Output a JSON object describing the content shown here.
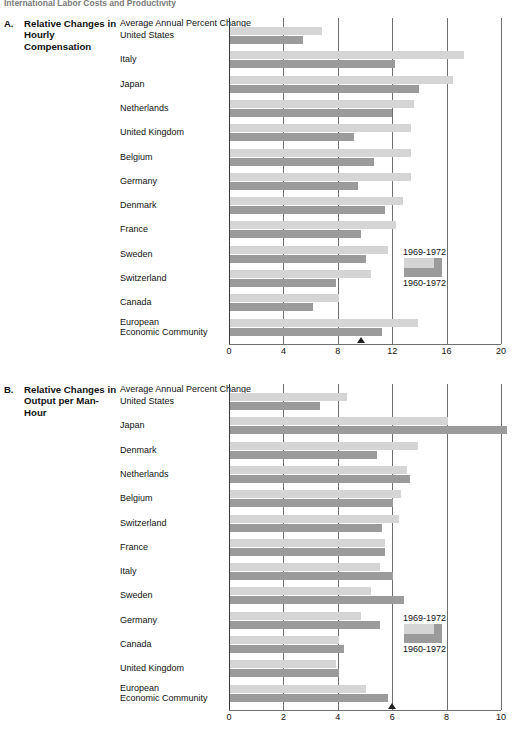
{
  "page_header": "International Labor Costs and Productivity",
  "legend": {
    "top_label": "1969-1972",
    "bottom_label": "1960-1972",
    "light_color": "#d5d5d5",
    "dark_color": "#9b9b9b"
  },
  "panels": [
    {
      "letter": "A.",
      "title": "Relative Changes in Hourly Compensation",
      "axis_caption": "Average Annual Percent Change"
    },
    {
      "letter": "B.",
      "title": "Relative Changes in Output per Man-Hour",
      "axis_caption": "Average Annual Percent Change"
    }
  ],
  "chart_data": [
    {
      "type": "bar",
      "title": "Relative Changes in Hourly Compensation",
      "subtitle": "Average Annual Percent Change",
      "orientation": "horizontal",
      "xlabel": "Average Annual Percent Change",
      "ylabel": "",
      "xlim": [
        0,
        20
      ],
      "xticks": [
        0,
        4,
        8,
        12,
        16,
        20
      ],
      "grid": true,
      "legend": [
        "1969-1972",
        "1960-1972"
      ],
      "legend_position": "inside-right",
      "annotation_marker": {
        "value": 9.7,
        "symbol": "triangle-up"
      },
      "categories": [
        "United States",
        "Italy",
        "Japan",
        "Netherlands",
        "United Kingdom",
        "Belgium",
        "Germany",
        "Denmark",
        "France",
        "Sweden",
        "Switzerland",
        "Canada",
        "European Economic Community"
      ],
      "series": [
        {
          "name": "1969-1972",
          "values": [
            6.8,
            17.2,
            16.4,
            13.5,
            13.3,
            13.3,
            13.3,
            12.7,
            12.2,
            11.6,
            10.4,
            8.0,
            13.8
          ]
        },
        {
          "name": "1960-1972",
          "values": [
            5.4,
            12.1,
            13.9,
            11.9,
            9.1,
            10.6,
            9.4,
            11.4,
            9.6,
            10.0,
            7.8,
            6.1,
            11.2
          ]
        }
      ]
    },
    {
      "type": "bar",
      "title": "Relative Changes in Output per Man-Hour",
      "subtitle": "Average Annual Percent Change",
      "orientation": "horizontal",
      "xlabel": "Average Annual Percent Change",
      "ylabel": "",
      "xlim": [
        0,
        10
      ],
      "xticks": [
        0,
        2,
        4,
        6,
        8,
        10
      ],
      "grid": true,
      "legend": [
        "1969-1972",
        "1960-1972"
      ],
      "legend_position": "inside-right",
      "annotation_marker": {
        "value": 6.0,
        "symbol": "triangle-up"
      },
      "categories": [
        "United States",
        "Japan",
        "Denmark",
        "Netherlands",
        "Belgium",
        "Switzerland",
        "France",
        "Italy",
        "Sweden",
        "Germany",
        "Canada",
        "United Kingdom",
        "European Economic Community"
      ],
      "series": [
        {
          "name": "1969-1972",
          "values": [
            4.3,
            8.0,
            6.9,
            6.5,
            6.3,
            6.2,
            5.7,
            5.5,
            5.2,
            4.8,
            4.0,
            3.9,
            5.0
          ]
        },
        {
          "name": "1960-1972",
          "values": [
            3.3,
            10.2,
            5.4,
            6.6,
            6.0,
            5.6,
            5.7,
            6.0,
            6.4,
            5.5,
            4.2,
            4.0,
            5.8
          ]
        }
      ]
    }
  ]
}
